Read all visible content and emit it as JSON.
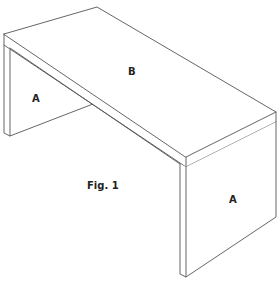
{
  "figure": {
    "caption": "Fig. 1",
    "parts": [
      {
        "id": "top",
        "label": "B"
      },
      {
        "id": "left-leg",
        "label": "A"
      },
      {
        "id": "right-leg",
        "label": "A"
      }
    ],
    "line_color": "#555555",
    "background": "#ffffff"
  }
}
